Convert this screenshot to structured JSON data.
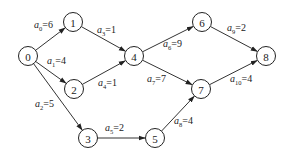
{
  "colors": {
    "stroke": "#222222",
    "background": "#ffffff"
  },
  "nodes": [
    {
      "id": "0",
      "label": "0",
      "x": 28,
      "y": 56
    },
    {
      "id": "1",
      "label": "1",
      "x": 73,
      "y": 22
    },
    {
      "id": "2",
      "label": "2",
      "x": 74,
      "y": 89
    },
    {
      "id": "3",
      "label": "3",
      "x": 88,
      "y": 138
    },
    {
      "id": "4",
      "label": "4",
      "x": 134,
      "y": 56
    },
    {
      "id": "5",
      "label": "5",
      "x": 155,
      "y": 138
    },
    {
      "id": "6",
      "label": "6",
      "x": 202,
      "y": 22
    },
    {
      "id": "7",
      "label": "7",
      "x": 201,
      "y": 89
    },
    {
      "id": "8",
      "label": "8",
      "x": 266,
      "y": 56
    }
  ],
  "edges": [
    {
      "name": "a",
      "sub": "0",
      "weight": "6",
      "from": "0",
      "to": "1",
      "lx": 34,
      "ly": 28
    },
    {
      "name": "a",
      "sub": "1",
      "weight": "4",
      "from": "0",
      "to": "2",
      "lx": 47,
      "ly": 64
    },
    {
      "name": "a",
      "sub": "2",
      "weight": "5",
      "from": "0",
      "to": "3",
      "lx": 35,
      "ly": 107
    },
    {
      "name": "a",
      "sub": "3",
      "weight": "1",
      "from": "1",
      "to": "4",
      "lx": 97,
      "ly": 33
    },
    {
      "name": "a",
      "sub": "4",
      "weight": "1",
      "from": "2",
      "to": "4",
      "lx": 98,
      "ly": 86
    },
    {
      "name": "a",
      "sub": "5",
      "weight": "2",
      "from": "3",
      "to": "5",
      "lx": 105,
      "ly": 131
    },
    {
      "name": "a",
      "sub": "6",
      "weight": "9",
      "from": "4",
      "to": "6",
      "lx": 163,
      "ly": 47
    },
    {
      "name": "a",
      "sub": "7",
      "weight": "7",
      "from": "4",
      "to": "7",
      "lx": 147,
      "ly": 82
    },
    {
      "name": "a",
      "sub": "8",
      "weight": "4",
      "from": "5",
      "to": "7",
      "lx": 174,
      "ly": 124
    },
    {
      "name": "a",
      "sub": "9",
      "weight": "2",
      "from": "6",
      "to": "8",
      "lx": 227,
      "ly": 31
    },
    {
      "name": "a",
      "sub": "10",
      "weight": "4",
      "from": "7",
      "to": "8",
      "lx": 230,
      "ly": 82
    }
  ],
  "node_radius": 9.5
}
